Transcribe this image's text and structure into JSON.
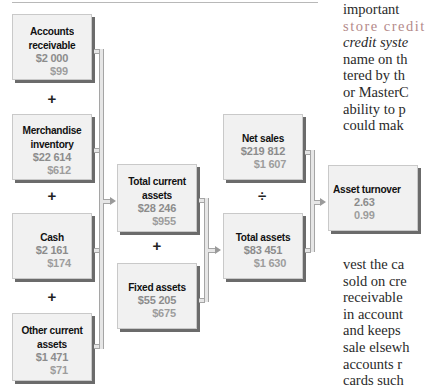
{
  "diagram": {
    "boxes": {
      "accounts_receivable": {
        "label_line1": "Accounts",
        "label_line2": "receivable",
        "value": "$2 000",
        "secondary": "$99"
      },
      "merchandise_inventory": {
        "label_line1": "Merchandise",
        "label_line2": "inventory",
        "value": "$22 614",
        "secondary": "$612"
      },
      "cash": {
        "label_line1": "Cash",
        "value": "$2 161",
        "secondary": "$174"
      },
      "other_current_assets": {
        "label_line1": "Other current",
        "label_line2": "assets",
        "value": "$1 471",
        "secondary": "$71"
      },
      "total_current_assets": {
        "label_line1": "Total current",
        "label_line2": "assets",
        "value": "$28 246",
        "secondary": "$955"
      },
      "fixed_assets": {
        "label_line1": "Fixed assets",
        "value": "$55 205",
        "secondary": "$675"
      },
      "net_sales": {
        "label_line1": "Net sales",
        "value": "$219 812",
        "secondary": "$1 607"
      },
      "total_assets": {
        "label_line1": "Total assets",
        "value": "$83 451",
        "secondary": "$1 630"
      },
      "asset_turnover": {
        "label_line1": "Asset turnover",
        "value": "2.63",
        "secondary": "0.99"
      }
    },
    "operators": {
      "plus": "+",
      "divide": "÷"
    }
  },
  "body_text": {
    "top_lines": [
      "important",
      "store credit",
      "credit syste",
      "name on th",
      "tered by th",
      "or MasterC",
      "ability to p",
      "could mak"
    ],
    "bottom_lines": [
      "vest the ca",
      "sold on cre",
      "receivable",
      "in account",
      "and keeps",
      "sale elsewh",
      "accounts r",
      "cards such"
    ]
  }
}
